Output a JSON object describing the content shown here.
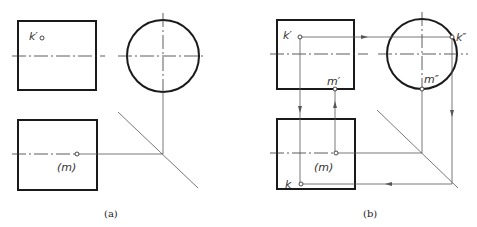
{
  "figure_a": {
    "caption": "(a)",
    "labels": {
      "k_front": "k′",
      "m_top": "(m)"
    }
  },
  "figure_b": {
    "caption": "(b)",
    "labels": {
      "k_front": "k′",
      "m_front": "m′",
      "k_side": "k″",
      "m_side": "m″",
      "m_top": "(m)",
      "k_top": "k"
    }
  },
  "colors": {
    "outline": "#1a1a1a",
    "projection_line": "#555555",
    "background": "#ffffff"
  }
}
